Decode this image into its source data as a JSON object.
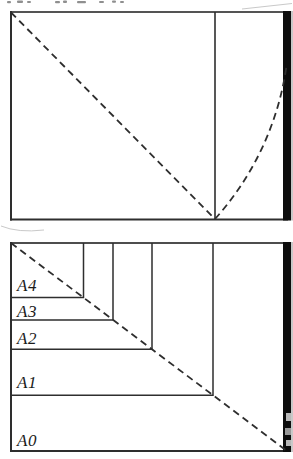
{
  "colors": {
    "background": "#ffffff",
    "line": "#2e2e2e",
    "edge_bar": "#0d0d0d",
    "label": "#1b1b1b",
    "artifact": "#8f8f8f"
  },
  "paper_size_labels": [
    "A4",
    "A3",
    "A2",
    "A1",
    "A0"
  ]
}
